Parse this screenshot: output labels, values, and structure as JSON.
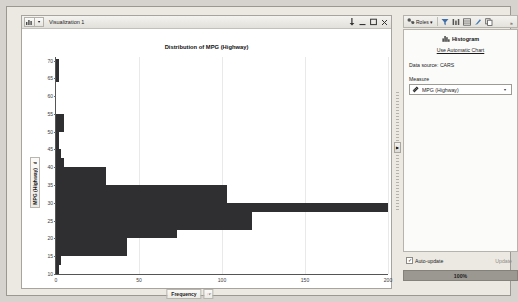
{
  "window": {
    "title": "Visualization 1",
    "menu_icon": "chart-icon",
    "caret_icon": "chevron-down-icon",
    "controls": [
      {
        "name": "pin-icon",
        "glyph": "⇩"
      },
      {
        "name": "minimize-icon",
        "glyph": "–"
      },
      {
        "name": "maximize-icon",
        "glyph": "▭"
      },
      {
        "name": "close-icon",
        "glyph": "✕"
      }
    ]
  },
  "chart_data": {
    "type": "bar",
    "orientation": "horizontal",
    "title": "Distribution of MPG (Highway)",
    "xlabel": "Frequency",
    "ylabel": "MPG (Highway)",
    "xlim": [
      0,
      200
    ],
    "ylim": [
      10,
      71
    ],
    "xticks": [
      0,
      50,
      100,
      150,
      200
    ],
    "yticks": [
      10,
      15,
      20,
      25,
      30,
      35,
      40,
      45,
      50,
      55,
      60,
      65,
      70
    ],
    "grid": "vertical-only",
    "bar_color": "#2f2f31",
    "bin_width": 2.5,
    "bins": [
      {
        "bin_start": 10.0,
        "bin_end": 12.5,
        "frequency": 2
      },
      {
        "bin_start": 12.5,
        "bin_end": 15.0,
        "frequency": 3
      },
      {
        "bin_start": 15.0,
        "bin_end": 17.5,
        "frequency": 43
      },
      {
        "bin_start": 17.5,
        "bin_end": 20.0,
        "frequency": 43
      },
      {
        "bin_start": 20.0,
        "bin_end": 22.5,
        "frequency": 73
      },
      {
        "bin_start": 22.5,
        "bin_end": 25.0,
        "frequency": 118
      },
      {
        "bin_start": 25.0,
        "bin_end": 27.5,
        "frequency": 118
      },
      {
        "bin_start": 27.5,
        "bin_end": 30.0,
        "frequency": 200
      },
      {
        "bin_start": 30.0,
        "bin_end": 32.5,
        "frequency": 103
      },
      {
        "bin_start": 32.5,
        "bin_end": 35.0,
        "frequency": 103
      },
      {
        "bin_start": 35.0,
        "bin_end": 37.5,
        "frequency": 30
      },
      {
        "bin_start": 37.5,
        "bin_end": 40.0,
        "frequency": 30
      },
      {
        "bin_start": 40.0,
        "bin_end": 42.5,
        "frequency": 5
      },
      {
        "bin_start": 42.5,
        "bin_end": 45.0,
        "frequency": 3
      },
      {
        "bin_start": 45.0,
        "bin_end": 47.5,
        "frequency": 2
      },
      {
        "bin_start": 47.5,
        "bin_end": 50.0,
        "frequency": 2
      },
      {
        "bin_start": 50.0,
        "bin_end": 52.5,
        "frequency": 5
      },
      {
        "bin_start": 52.5,
        "bin_end": 55.0,
        "frequency": 5
      },
      {
        "bin_start": 64.0,
        "bin_end": 70.5,
        "frequency": 2
      }
    ]
  },
  "axis_labels": {
    "y_ruler_icon": "ruler-icon",
    "x_hand_icon": "hand-pointer-icon"
  },
  "right_panel": {
    "toolbar": {
      "roles_label": "Roles",
      "roles_caret": "▾",
      "roles_icon": "roles-icon",
      "icons": [
        {
          "name": "filter-icon",
          "glyph": "▽"
        },
        {
          "name": "columns-icon",
          "glyph": "⦀"
        },
        {
          "name": "table-icon",
          "glyph": "▤"
        },
        {
          "name": "paint-icon",
          "glyph": "✒"
        },
        {
          "name": "copy-icon",
          "glyph": "❐"
        }
      ],
      "overflow_glyph": "»"
    },
    "heading": "Histogram",
    "heading_icon": "histogram-icon",
    "auto_chart_link": "Use Automatic Chart",
    "data_source_label": "Data source:",
    "data_source_value": "CARS",
    "measure_label": "Measure",
    "measure_value": "MPG (Highway)",
    "measure_icon": "ruler-icon",
    "measure_caret": "▾",
    "auto_update_label": "Auto-update",
    "auto_update_checked": true,
    "check_glyph": "✓",
    "update_button": "Update",
    "progress_label": "100%"
  }
}
